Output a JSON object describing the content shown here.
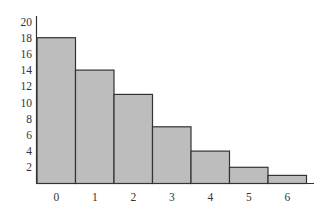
{
  "chart_data": {
    "type": "bar",
    "title": "",
    "xlabel": "",
    "ylabel": "",
    "categories": [
      "0",
      "1",
      "2",
      "3",
      "4",
      "5",
      "6"
    ],
    "values": [
      18,
      14,
      11,
      7,
      4,
      2,
      1
    ],
    "ylim": [
      0,
      20
    ],
    "yticks": [
      2,
      4,
      6,
      8,
      10,
      12,
      14,
      16,
      18,
      20
    ],
    "grid": false,
    "legend": null,
    "bar_color": "#bdbdbd",
    "edge_color": "#333333"
  }
}
